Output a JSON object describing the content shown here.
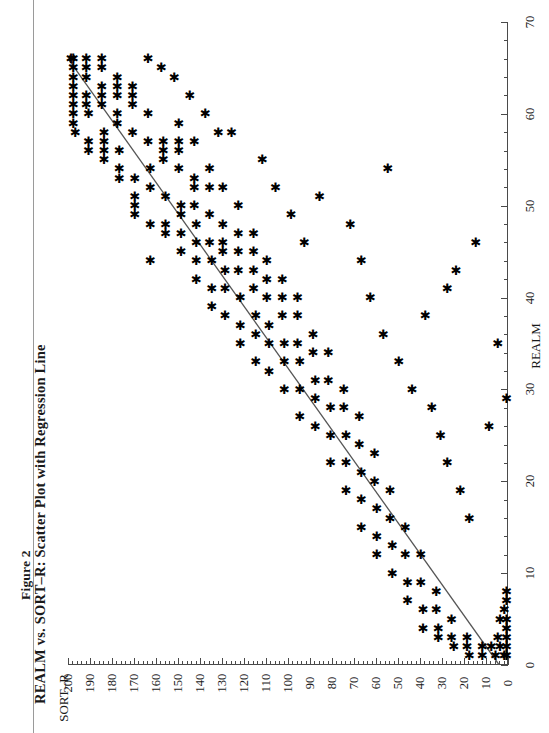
{
  "figure": {
    "label": "Figure 2",
    "title": "REALM vs. SORT–R: Scatter Plot with Regression Line"
  },
  "axes": {
    "sort_r": {
      "name": "SORT–R",
      "ticks": [
        0,
        10,
        20,
        30,
        40,
        50,
        60,
        70,
        80,
        90,
        100,
        110,
        120,
        130,
        140,
        150,
        160,
        170,
        180,
        190,
        200
      ],
      "tick_labels": [
        "0",
        "10",
        "20",
        "30",
        "40",
        "50",
        "60",
        "70",
        "80",
        "90",
        "100",
        "110",
        "120",
        "130",
        "140",
        "150",
        "160",
        "170",
        "180",
        "190",
        "200"
      ],
      "min": 0,
      "max": 200,
      "minor_step": 2
    },
    "realm": {
      "name": "REALM",
      "ticks": [
        0,
        10,
        20,
        30,
        40,
        50,
        60,
        70
      ],
      "tick_labels": [
        "0",
        "10",
        "20",
        "30",
        "40",
        "50",
        "60",
        "70"
      ],
      "min": 0,
      "max": 70,
      "minor_step": 2
    }
  },
  "style": {
    "marker_color": "#000000",
    "line_color": "#555555",
    "axis_color": "#4a4a4a",
    "background": "#ffffff"
  },
  "chart_data": {
    "type": "scatter",
    "title": "REALM vs. SORT–R: Scatter Plot with Regression Line",
    "subtitle": "Figure 2",
    "xlabel": "REALM",
    "ylabel": "SORT–R",
    "xlim": [
      0,
      70
    ],
    "ylim": [
      0,
      200
    ],
    "grid": false,
    "legend": null,
    "rotation_degrees": 90,
    "regression_line": {
      "x": [
        0,
        66
      ],
      "y": [
        4,
        205
      ],
      "color": "#555555"
    },
    "points": [
      [
        66,
        198
      ],
      [
        66,
        199
      ],
      [
        65,
        198
      ],
      [
        64,
        198
      ],
      [
        63,
        198
      ],
      [
        62,
        198
      ],
      [
        61,
        198
      ],
      [
        60,
        198
      ],
      [
        59,
        198
      ],
      [
        58,
        197
      ],
      [
        66,
        192
      ],
      [
        65,
        192
      ],
      [
        64,
        192
      ],
      [
        62,
        192
      ],
      [
        61,
        192
      ],
      [
        60,
        191
      ],
      [
        57,
        191
      ],
      [
        56,
        191
      ],
      [
        66,
        185
      ],
      [
        65,
        185
      ],
      [
        63,
        185
      ],
      [
        62,
        185
      ],
      [
        61,
        185
      ],
      [
        58,
        184
      ],
      [
        57,
        184
      ],
      [
        56,
        184
      ],
      [
        55,
        184
      ],
      [
        64,
        178
      ],
      [
        63,
        178
      ],
      [
        62,
        178
      ],
      [
        60,
        178
      ],
      [
        59,
        178
      ],
      [
        56,
        177
      ],
      [
        54,
        177
      ],
      [
        53,
        177
      ],
      [
        63,
        171
      ],
      [
        62,
        171
      ],
      [
        61,
        171
      ],
      [
        58,
        171
      ],
      [
        53,
        170
      ],
      [
        51,
        170
      ],
      [
        50,
        170
      ],
      [
        49,
        170
      ],
      [
        66,
        164
      ],
      [
        60,
        164
      ],
      [
        57,
        164
      ],
      [
        54,
        163
      ],
      [
        52,
        163
      ],
      [
        48,
        163
      ],
      [
        44,
        163
      ],
      [
        57,
        157
      ],
      [
        56,
        157
      ],
      [
        55,
        157
      ],
      [
        51,
        156
      ],
      [
        48,
        156
      ],
      [
        47,
        156
      ],
      [
        59,
        150
      ],
      [
        57,
        150
      ],
      [
        56,
        150
      ],
      [
        54,
        150
      ],
      [
        50,
        149
      ],
      [
        49,
        149
      ],
      [
        47,
        149
      ],
      [
        45,
        149
      ],
      [
        57,
        143
      ],
      [
        53,
        143
      ],
      [
        52,
        143
      ],
      [
        50,
        143
      ],
      [
        48,
        142
      ],
      [
        46,
        142
      ],
      [
        44,
        142
      ],
      [
        42,
        142
      ],
      [
        54,
        136
      ],
      [
        52,
        136
      ],
      [
        49,
        136
      ],
      [
        46,
        136
      ],
      [
        44,
        135
      ],
      [
        41,
        135
      ],
      [
        39,
        135
      ],
      [
        52,
        130
      ],
      [
        48,
        130
      ],
      [
        46,
        130
      ],
      [
        45,
        130
      ],
      [
        43,
        129
      ],
      [
        41,
        129
      ],
      [
        38,
        129
      ],
      [
        50,
        123
      ],
      [
        47,
        123
      ],
      [
        45,
        123
      ],
      [
        43,
        123
      ],
      [
        40,
        122
      ],
      [
        37,
        122
      ],
      [
        35,
        122
      ],
      [
        47,
        116
      ],
      [
        45,
        116
      ],
      [
        43,
        116
      ],
      [
        41,
        116
      ],
      [
        38,
        115
      ],
      [
        36,
        115
      ],
      [
        33,
        115
      ],
      [
        44,
        110
      ],
      [
        42,
        110
      ],
      [
        40,
        110
      ],
      [
        37,
        109
      ],
      [
        35,
        109
      ],
      [
        32,
        109
      ],
      [
        42,
        103
      ],
      [
        40,
        103
      ],
      [
        38,
        103
      ],
      [
        35,
        102
      ],
      [
        33,
        102
      ],
      [
        30,
        102
      ],
      [
        40,
        96
      ],
      [
        38,
        96
      ],
      [
        35,
        96
      ],
      [
        33,
        95
      ],
      [
        30,
        95
      ],
      [
        27,
        95
      ],
      [
        36,
        89
      ],
      [
        34,
        89
      ],
      [
        31,
        88
      ],
      [
        29,
        88
      ],
      [
        26,
        88
      ],
      [
        34,
        82
      ],
      [
        31,
        82
      ],
      [
        28,
        81
      ],
      [
        25,
        81
      ],
      [
        22,
        81
      ],
      [
        30,
        75
      ],
      [
        28,
        75
      ],
      [
        25,
        74
      ],
      [
        22,
        74
      ],
      [
        19,
        74
      ],
      [
        27,
        68
      ],
      [
        24,
        68
      ],
      [
        21,
        67
      ],
      [
        18,
        67
      ],
      [
        15,
        67
      ],
      [
        23,
        61
      ],
      [
        20,
        61
      ],
      [
        17,
        60
      ],
      [
        14,
        60
      ],
      [
        12,
        60
      ],
      [
        19,
        54
      ],
      [
        16,
        54
      ],
      [
        13,
        53
      ],
      [
        10,
        53
      ],
      [
        15,
        47
      ],
      [
        12,
        47
      ],
      [
        9,
        46
      ],
      [
        7,
        46
      ],
      [
        12,
        40
      ],
      [
        9,
        40
      ],
      [
        6,
        39
      ],
      [
        4,
        39
      ],
      [
        8,
        33
      ],
      [
        6,
        33
      ],
      [
        4,
        32
      ],
      [
        3,
        32
      ],
      [
        5,
        26
      ],
      [
        3,
        26
      ],
      [
        2,
        25
      ],
      [
        3,
        19
      ],
      [
        2,
        19
      ],
      [
        1,
        18
      ],
      [
        2,
        12
      ],
      [
        1,
        12
      ],
      [
        2,
        8
      ],
      [
        1,
        6
      ],
      [
        1,
        2
      ],
      [
        1,
        1
      ],
      [
        2,
        1
      ],
      [
        3,
        1
      ],
      [
        4,
        1
      ],
      [
        5,
        1
      ],
      [
        7,
        1
      ],
      [
        8,
        1
      ],
      [
        2,
        4
      ],
      [
        3,
        5
      ],
      [
        5,
        4
      ],
      [
        6,
        2
      ],
      [
        29,
        1
      ],
      [
        26,
        9
      ],
      [
        35,
        5
      ],
      [
        38,
        38
      ],
      [
        54,
        55
      ],
      [
        46,
        15
      ],
      [
        43,
        24
      ],
      [
        41,
        28
      ],
      [
        48,
        72
      ],
      [
        51,
        86
      ],
      [
        44,
        67
      ],
      [
        40,
        63
      ],
      [
        36,
        57
      ],
      [
        33,
        50
      ],
      [
        30,
        44
      ],
      [
        58,
        126
      ],
      [
        55,
        112
      ],
      [
        52,
        106
      ],
      [
        49,
        99
      ],
      [
        46,
        93
      ],
      [
        62,
        145
      ],
      [
        60,
        138
      ],
      [
        58,
        132
      ],
      [
        64,
        152
      ],
      [
        65,
        158
      ],
      [
        28,
        35
      ],
      [
        25,
        31
      ],
      [
        22,
        28
      ],
      [
        19,
        22
      ],
      [
        16,
        18
      ]
    ],
    "n_points": 200,
    "relationship": "positive linear correlation"
  }
}
